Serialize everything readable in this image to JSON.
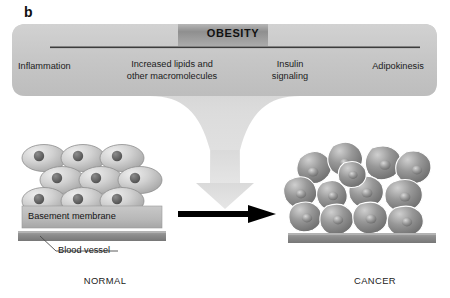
{
  "figure": {
    "panel_letter": "b",
    "type": "diagram"
  },
  "banner": {
    "title": "OBESITY",
    "factors": [
      {
        "id": "inflammation",
        "label": "Inflammation"
      },
      {
        "id": "lipids",
        "label": "Increased lipids and\nother macromolecules",
        "line1": "Increased lipids and",
        "line2": "other macromolecules"
      },
      {
        "id": "insulin",
        "label": "Insulin\nsignaling",
        "line1": "Insulin",
        "line2": "signaling"
      },
      {
        "id": "adipokinesis",
        "label": "Adipokinesis"
      }
    ]
  },
  "left_panel": {
    "caption": "NORMAL",
    "annotations": [
      {
        "id": "basement-membrane",
        "label": "Basement membrane"
      },
      {
        "id": "blood-vessel",
        "label": "Blood vessel"
      }
    ],
    "cell_rows": 3,
    "cells_per_row": 3,
    "cell_description": "ordered rounded epithelial cells with dark nuclei"
  },
  "right_panel": {
    "caption": "CANCER",
    "cell_count": 13,
    "cell_description": "irregular disorganized dark cancer cells invading past the basement membrane"
  },
  "transition_arrow": {
    "direction": "left-to-right",
    "color": "#000000"
  },
  "funnel_arrow": {
    "direction": "down",
    "color": "#d9d9d9"
  },
  "colors": {
    "banner_fill": "#c9c9c9",
    "banner_dark_band": "#9c9c9c",
    "rule_line": "#3c3c3c",
    "normal_cell": "#c4c4c4",
    "cancer_cell": "#8e8e8e",
    "basement_membrane": "#b5b5b5",
    "blood_vessel": "#8f8f8f",
    "background": "#ffffff"
  }
}
